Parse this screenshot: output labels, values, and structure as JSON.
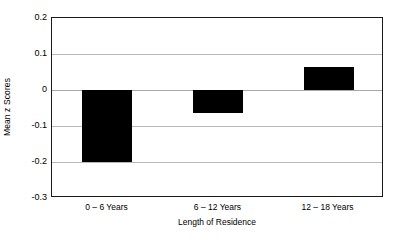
{
  "chart_data": {
    "type": "bar",
    "title": "",
    "subtitle": "",
    "xlabel": "Length of Residence",
    "ylabel": "Mean z Scores",
    "categories": [
      "0 – 6 Years",
      "6 – 12 Years",
      "12 – 18 Years"
    ],
    "values": [
      -0.2,
      -0.065,
      0.065
    ],
    "series": [
      {
        "name": "Mean z Scores",
        "values": [
          -0.2,
          -0.065,
          0.065
        ]
      }
    ],
    "ylim": [
      -0.3,
      0.2
    ],
    "yticks": [
      0.2,
      0.1,
      0,
      -0.1,
      -0.2,
      -0.3
    ],
    "ytick_labels": [
      "0.2",
      "0.1",
      "0",
      "-0.1",
      "-0.2",
      "-0.3"
    ],
    "grid": true,
    "grid_axis": "y",
    "legend": false,
    "legend_position": "none",
    "bar_color": "#000000",
    "grid_color": "#b9b9b9",
    "frame_color": "#1a1a1a",
    "background_color": "#ffffff",
    "annotations": []
  },
  "axis": {
    "y_title": "Mean z Scores",
    "x_title": "Length of Residence"
  }
}
